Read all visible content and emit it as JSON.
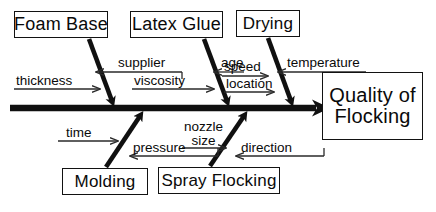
{
  "diagram": {
    "type": "fishbone-ishikawa",
    "effect": {
      "line1": "Quality of",
      "line2": "Flocking"
    },
    "spine": {
      "direction": "left-to-right",
      "arrowhead": "right"
    },
    "categories": [
      {
        "id": "foam-base",
        "label": "Foam Base",
        "position": "top",
        "factors": [
          {
            "label": "thickness",
            "arrow": "right"
          },
          {
            "label": "supplier",
            "arrow": "left"
          }
        ]
      },
      {
        "id": "latex-glue",
        "label": "Latex Glue",
        "position": "top",
        "factors": [
          {
            "label": "viscosity",
            "arrow": "right"
          },
          {
            "label": "age",
            "arrow": "left"
          }
        ]
      },
      {
        "id": "drying",
        "label": "Drying",
        "position": "top",
        "factors": [
          {
            "label": "speed",
            "arrow": "right"
          },
          {
            "label": "location",
            "arrow": "right"
          },
          {
            "label": "temperature",
            "arrow": "left"
          }
        ]
      },
      {
        "id": "molding",
        "label": "Molding",
        "position": "bottom",
        "factors": [
          {
            "label": "time",
            "arrow": "right"
          },
          {
            "label": "pressure",
            "arrow": "left"
          }
        ]
      },
      {
        "id": "spray-flocking",
        "label": "Spray Flocking",
        "position": "bottom",
        "factors": [
          {
            "label_line1": "nozzle",
            "label_line2": "size",
            "arrow": "right"
          },
          {
            "label": "direction",
            "arrow": "left"
          }
        ]
      }
    ],
    "labels": {
      "thickness": "thickness",
      "supplier": "supplier",
      "viscosity": "viscosity",
      "age": "age",
      "speed": "speed",
      "location": "location",
      "temperature": "temperature",
      "time": "time",
      "pressure": "pressure",
      "nozzle_line1": "nozzle",
      "nozzle_line2": "size",
      "direction": "direction"
    },
    "colors": {
      "ink": "#0a0a0a",
      "spine": "#101010",
      "thin_line": "#2a2a2a",
      "background": "#ffffff"
    }
  }
}
